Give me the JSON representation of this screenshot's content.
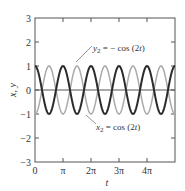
{
  "chart_data": {
    "type": "line",
    "title": "",
    "xlabel": "t",
    "ylabel": "x, y",
    "xlim": [
      0,
      15.708
    ],
    "ylim": [
      -3,
      3
    ],
    "grid": false,
    "legend": "none (inline annotations)",
    "x_ticks": [
      {
        "value": 0,
        "label": "0"
      },
      {
        "value": 3.1416,
        "label": "π"
      },
      {
        "value": 6.2832,
        "label": "2π"
      },
      {
        "value": 9.4248,
        "label": "3π"
      },
      {
        "value": 12.5664,
        "label": "4π"
      }
    ],
    "y_ticks": [
      {
        "value": 3,
        "label": "3"
      },
      {
        "value": 2,
        "label": "2"
      },
      {
        "value": 1,
        "label": "1"
      },
      {
        "value": 0,
        "label": "0"
      },
      {
        "value": -1,
        "label": "-1"
      },
      {
        "value": -2,
        "label": "-2"
      },
      {
        "value": -3,
        "label": "-3"
      }
    ],
    "series": [
      {
        "name": "x2 = cos(2t)",
        "expression": "cos(2t)",
        "color": "#2b2b2b",
        "stroke_width": 2,
        "x": [
          0,
          0.785,
          1.571,
          2.356,
          3.142,
          3.927,
          4.712,
          5.498,
          6.283,
          7.069,
          7.854,
          8.639,
          9.425,
          10.21,
          10.996,
          11.781,
          12.566,
          13.352,
          14.137,
          14.923,
          15.708
        ],
        "values": [
          1,
          0,
          -1,
          0,
          1,
          0,
          -1,
          0,
          1,
          0,
          -1,
          0,
          1,
          0,
          -1,
          0,
          1,
          0,
          -1,
          0,
          1
        ]
      },
      {
        "name": "y2 = -cos(2t)",
        "expression": "-cos(2t)",
        "color": "#aaaaaa",
        "stroke_width": 1.5,
        "x": [
          0,
          0.785,
          1.571,
          2.356,
          3.142,
          3.927,
          4.712,
          5.498,
          6.283,
          7.069,
          7.854,
          8.639,
          9.425,
          10.21,
          10.996,
          11.781,
          12.566,
          13.352,
          14.137,
          14.923,
          15.708
        ],
        "values": [
          -1,
          0,
          1,
          0,
          -1,
          0,
          1,
          0,
          -1,
          0,
          1,
          0,
          -1,
          0,
          1,
          0,
          -1,
          0,
          1,
          0,
          -1
        ]
      }
    ],
    "annotations": [
      {
        "text": "y₂ = − cos (2t)",
        "points_to": "y2 series near t≈1.5π, y≈0.5"
      },
      {
        "text": "x₂ = cos (2t)",
        "points_to": "x2 series near t≈1.5π, y≈-0.9"
      }
    ],
    "reference_lines": [
      {
        "axis": "y",
        "value": 0
      }
    ]
  },
  "labels": {
    "xlabel": "t",
    "ylabel": "x, y",
    "annot_y2_prefix": "y",
    "annot_y2_sub": "2",
    "annot_y2_rest": " = − cos (2",
    "annot_y2_t": "t",
    "annot_y2_close": ")",
    "annot_x2_prefix": "x",
    "annot_x2_sub": "2",
    "annot_x2_rest": " = cos (2",
    "annot_x2_t": "t",
    "annot_x2_close": ")"
  }
}
